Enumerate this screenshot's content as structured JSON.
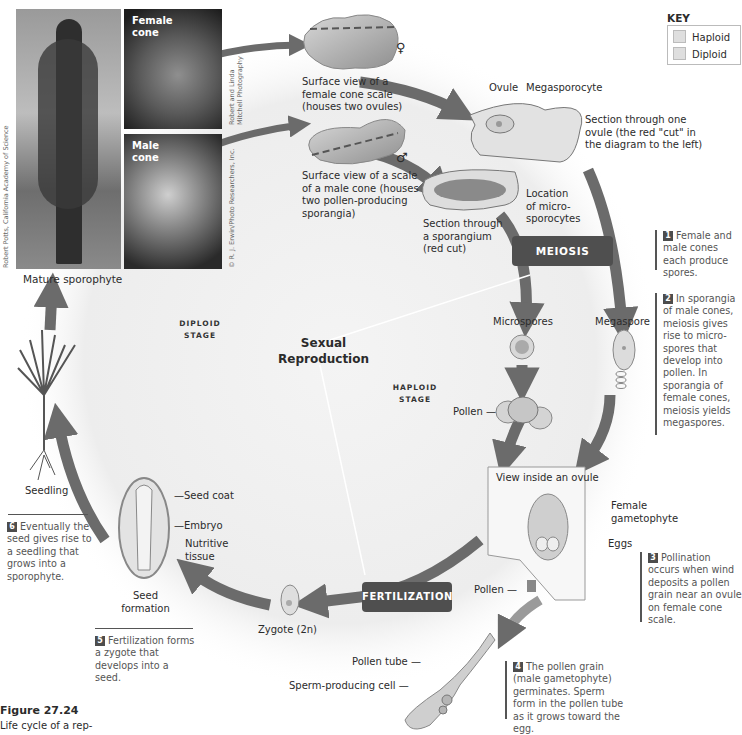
{
  "figure": {
    "number": "Figure 27.24",
    "caption": "Life cycle of a rep-"
  },
  "key": {
    "title": "KEY",
    "items": [
      {
        "label": "Haploid",
        "color": "#dedede"
      },
      {
        "label": "Diploid",
        "color": "#dedede"
      }
    ]
  },
  "photos": {
    "tree": {
      "caption": "Mature sporophyte",
      "credit": "Robert Potts, California Academy of Science"
    },
    "female_cone": {
      "label_line1": "Female",
      "label_line2": "cone",
      "credit_line1": "Robert and Linda",
      "credit_line2": "Mitchell Photography"
    },
    "male_cone": {
      "label_line1": "Male",
      "label_line2": "cone",
      "credit": "© R. J. Erwin/Photo Researchers, Inc."
    }
  },
  "labels": {
    "female_scale": [
      "Surface view of a",
      "female cone scale",
      "(houses two ovules)"
    ],
    "male_scale": [
      "Surface view of a scale",
      "of a male cone (houses",
      "two pollen-producing",
      "sporangia)"
    ],
    "female_symbol": "♀",
    "male_symbol": "♂",
    "ovule": "Ovule",
    "megasporocyte": "Megasporocyte",
    "ovule_section": [
      "Section through one",
      "ovule (the red \"cut\" in",
      "the diagram to the left)"
    ],
    "sporangium_section": [
      "Section through",
      "a sporangium",
      "(red cut)"
    ],
    "microsporocytes": [
      "Location",
      "of micro-",
      "sporocytes"
    ],
    "meiosis": "MEIOSIS",
    "microspores": "Microspores",
    "megaspore": "Megaspore",
    "pollen": "Pollen",
    "view_inside_ovule": "View inside an ovule",
    "female_gametophyte": [
      "Female",
      "gametophyte"
    ],
    "eggs": "Eggs",
    "pollen_ovule": "Pollen",
    "fertilization": "FERTILIZATION",
    "zygote": "Zygote (2n)",
    "pollen_tube": "Pollen tube",
    "sperm_cell": "Sperm-producing cell",
    "seed_coat": "Seed coat",
    "embryo": "Embryo",
    "nutritive": [
      "Nutritive",
      "tissue"
    ],
    "seed_formation": [
      "Seed",
      "formation"
    ],
    "seedling": "Seedling",
    "sexual_reproduction": [
      "Sexual",
      "Reproduction"
    ],
    "diploid_stage": [
      "DIPLOID",
      "STAGE"
    ],
    "haploid_stage": [
      "HAPLOID",
      "STAGE"
    ]
  },
  "steps": [
    {
      "n": "1",
      "text": "Female and male cones each produce spores."
    },
    {
      "n": "2",
      "text": "In sporangia of male cones, meiosis gives rise to micro-spores that develop into pollen. In sporangia of female cones, meiosis yields megaspores."
    },
    {
      "n": "3",
      "text": "Pollination occurs when wind deposits a pollen grain near an ovule on female cone scale."
    },
    {
      "n": "4",
      "text": "The pollen grain (male gametophyte) germinates. Sperm form in the pollen tube as it grows toward the egg."
    },
    {
      "n": "5",
      "text": "Fertilization forms a zygote that develops into a seed."
    },
    {
      "n": "6",
      "text": "Eventually the seed gives rise to a seedling that grows into a sporophyte."
    }
  ],
  "colors": {
    "arrow": "#6b6b6b",
    "pill": "#4f4f4f",
    "background_glow": "#ececec"
  }
}
